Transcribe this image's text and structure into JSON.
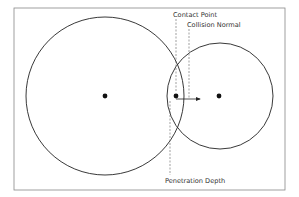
{
  "diagram": {
    "type": "circle-collision",
    "frame": {
      "x": 14,
      "y": 8,
      "width": 271,
      "height": 182,
      "stroke": "#888888"
    },
    "circles": [
      {
        "name": "circle-a",
        "cx": 105,
        "cy": 96,
        "r": 79,
        "stroke": "#222222"
      },
      {
        "name": "circle-b",
        "cx": 220,
        "cy": 96,
        "r": 53,
        "stroke": "#222222"
      }
    ],
    "center_points": [
      {
        "name": "center-a",
        "x": 105,
        "y": 96
      },
      {
        "name": "center-b",
        "x": 219,
        "y": 96
      }
    ],
    "contact_point": {
      "x": 176,
      "y": 96
    },
    "collision_normal_arrow": {
      "x1": 176,
      "y1": 99,
      "x2": 201,
      "y2": 99
    },
    "labels": {
      "contact_point": "Contact Point",
      "collision_normal": "Collision Normal",
      "penetration_depth": "Penetration Depth"
    },
    "leader_lines": {
      "contact_point": {
        "x": 176,
        "y1": 19,
        "y2": 92
      },
      "collision_normal": {
        "x": 189,
        "y1": 29,
        "y2": 99
      },
      "penetration_depth": {
        "x": 170,
        "y1": 101,
        "y2": 175
      }
    }
  }
}
